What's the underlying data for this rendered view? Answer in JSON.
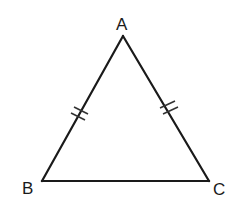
{
  "diagram": {
    "type": "isosceles-triangle",
    "stroke_color": "#1a1a1a",
    "background": "#ffffff",
    "vertices": {
      "A": {
        "label": "A",
        "x": 123,
        "y": 36
      },
      "B": {
        "label": "B",
        "x": 42,
        "y": 181
      },
      "C": {
        "label": "C",
        "x": 209,
        "y": 181
      }
    },
    "labels": {
      "A": "A",
      "B": "B",
      "C": "C"
    },
    "congruence_marks": [
      {
        "side": "AB",
        "count": 2
      },
      {
        "side": "AC",
        "count": 2
      }
    ]
  }
}
